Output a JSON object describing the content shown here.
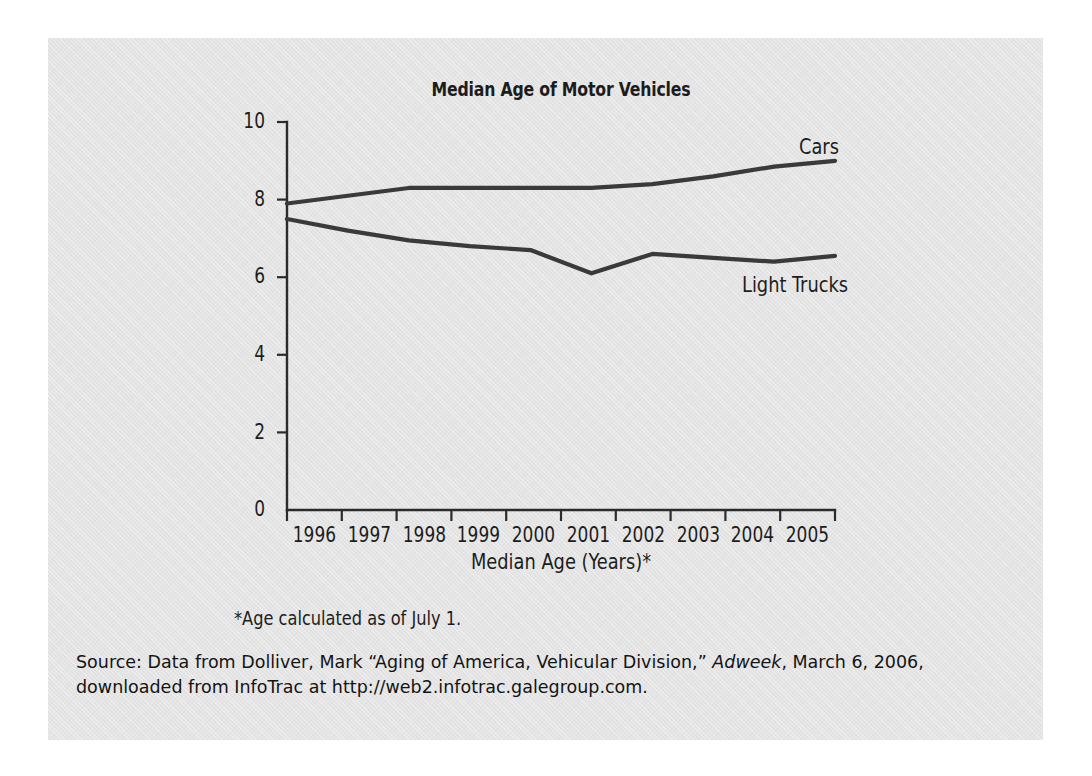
{
  "figure": {
    "title": "Median Age of Motor Vehicles",
    "x_axis_title": "Median Age (Years)*",
    "footnote": "*Age calculated as of July 1.",
    "panel_color": "#e4e4e4",
    "line_color": "#3a3a3a",
    "axis_color": "#2b2b2b"
  },
  "source": {
    "prefix": "Source: Data from Dolliver, Mark “Aging of America, Vehicular Division,” ",
    "publication": "Adweek",
    "suffix": ", March 6, 2006,",
    "line2": "downloaded from InfoTrac at http://web2.infotrac.galegroup.com."
  },
  "chart_data": {
    "type": "line",
    "title": "Median Age of Motor Vehicles",
    "xlabel": "Median Age (Years)*",
    "ylabel": "",
    "x": [
      1996,
      1997,
      1998,
      1999,
      2000,
      2001,
      2002,
      2003,
      2004,
      2005
    ],
    "categories": [
      "1996",
      "1997",
      "1998",
      "1999",
      "2000",
      "2001",
      "2002",
      "2003",
      "2004",
      "2005"
    ],
    "ylim": [
      0,
      10
    ],
    "yticks": [
      0,
      2,
      4,
      6,
      8,
      10
    ],
    "ytick_labels": [
      "0",
      "2",
      "4",
      "6",
      "8",
      "10"
    ],
    "grid": false,
    "legend_position": "inline-end-of-line",
    "series": [
      {
        "name": "Cars",
        "values": [
          7.9,
          8.1,
          8.3,
          8.3,
          8.3,
          8.3,
          8.4,
          8.6,
          8.85,
          9.0
        ]
      },
      {
        "name": "Light Trucks",
        "values": [
          7.5,
          7.2,
          6.95,
          6.8,
          6.7,
          6.1,
          6.6,
          6.5,
          6.4,
          6.55
        ]
      }
    ],
    "annotations": [
      "*Age calculated as of July 1."
    ]
  }
}
